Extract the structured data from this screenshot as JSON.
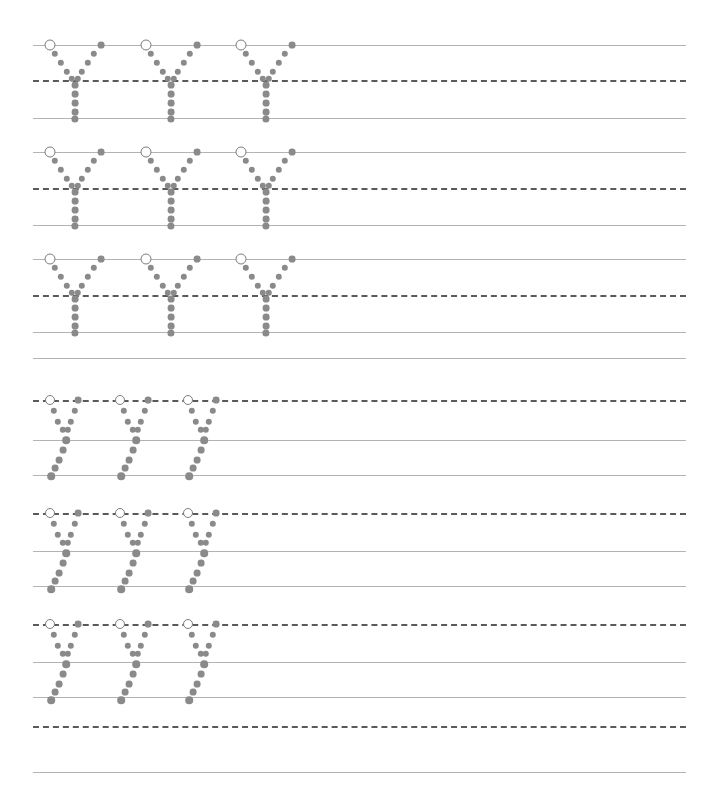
{
  "worksheet": {
    "title": "Letter Y Tracing Practice Worksheet",
    "description": "Handwriting practice sheet with dotted uppercase Y and lowercase y letters on three-line ruled guides",
    "page_width": 708,
    "page_height": 806,
    "background_color": "#ffffff",
    "line_color": "#b3b3b3",
    "dashed_line_color": "#5a5a5a",
    "dot_color": "#8a8a8a",
    "start_circle_color": "#7d7d7d",
    "line_left": 33,
    "line_right": 686
  },
  "rows": [
    {
      "name": "uppercase-y-row-1",
      "letter": "Y",
      "case": "uppercase",
      "top_line_y": 45,
      "mid_line_y": 80,
      "base_line_y": 118,
      "letter_x_positions": [
        50,
        146,
        241
      ],
      "letter_count": 3
    },
    {
      "name": "uppercase-y-row-2",
      "letter": "Y",
      "case": "uppercase",
      "top_line_y": 152,
      "mid_line_y": 188,
      "base_line_y": 225,
      "letter_x_positions": [
        50,
        146,
        241
      ],
      "letter_count": 3
    },
    {
      "name": "uppercase-y-row-3",
      "letter": "Y",
      "case": "uppercase",
      "top_line_y": 259,
      "mid_line_y": 295,
      "base_line_y": 332,
      "letter_x_positions": [
        50,
        146,
        241
      ],
      "letter_count": 3
    },
    {
      "name": "lowercase-y-row-1",
      "letter": "y",
      "case": "lowercase",
      "top_line_y": 358,
      "mid_line_y": 400,
      "base_line_y": 440,
      "descender_line_y": 475,
      "letter_x_positions": [
        50,
        120,
        188
      ],
      "letter_count": 3
    },
    {
      "name": "lowercase-y-row-2",
      "letter": "y",
      "case": "lowercase",
      "top_line_y": 475,
      "mid_line_y": 513,
      "base_line_y": 551,
      "descender_line_y": 586,
      "letter_x_positions": [
        50,
        120,
        188
      ],
      "letter_count": 3
    },
    {
      "name": "lowercase-y-row-3",
      "letter": "y",
      "case": "lowercase",
      "top_line_y": 586,
      "mid_line_y": 624,
      "base_line_y": 662,
      "descender_line_y": 697,
      "letter_x_positions": [
        50,
        120,
        188
      ],
      "letter_count": 3
    },
    {
      "name": "blank-practice-row",
      "letter": "",
      "case": "blank",
      "top_line_y": 697,
      "mid_line_y": 726,
      "base_line_y": 772,
      "letter_x_positions": [],
      "letter_count": 0
    }
  ],
  "glyph_templates": {
    "uppercase_Y": {
      "description": "Capital Y: left diagonal from top-left down to center, right diagonal from top-right down to center, vertical stem to baseline",
      "start_marker": {
        "dx": 0,
        "dy": 0,
        "r": 5.5
      },
      "dots": [
        {
          "dx": 5,
          "dy": 9,
          "r": 3.2
        },
        {
          "dx": 11,
          "dy": 18,
          "r": 3.2
        },
        {
          "dx": 17,
          "dy": 27,
          "r": 3.2
        },
        {
          "dx": 22,
          "dy": 34,
          "r": 3.2
        },
        {
          "dx": 51,
          "dy": 0,
          "r": 3.4
        },
        {
          "dx": 44,
          "dy": 9,
          "r": 3.2
        },
        {
          "dx": 38,
          "dy": 18,
          "r": 3.2
        },
        {
          "dx": 32,
          "dy": 27,
          "r": 3.2
        },
        {
          "dx": 28,
          "dy": 34,
          "r": 3.2
        },
        {
          "dx": 25,
          "dy": 40,
          "r": 3.4
        },
        {
          "dx": 25,
          "dy": 49,
          "r": 3.4
        },
        {
          "dx": 25,
          "dy": 58,
          "r": 3.4
        },
        {
          "dx": 25,
          "dy": 67,
          "r": 3.4
        },
        {
          "dx": 25,
          "dy": 74,
          "r": 3.6
        }
      ]
    },
    "lowercase_y": {
      "description": "Lowercase y: short left diagonal from midline to baseline, short right diagonal from midline down, then descender tail angling down-left below baseline",
      "start_marker": {
        "dx": 0,
        "dy": 0,
        "r": 5.0
      },
      "dots": [
        {
          "dx": 4,
          "dy": 11,
          "r": 3.2
        },
        {
          "dx": 8,
          "dy": 22,
          "r": 3.2
        },
        {
          "dx": 13,
          "dy": 30,
          "r": 3.2
        },
        {
          "dx": 28,
          "dy": 0,
          "r": 3.4
        },
        {
          "dx": 25,
          "dy": 11,
          "r": 3.2
        },
        {
          "dx": 21,
          "dy": 22,
          "r": 3.2
        },
        {
          "dx": 18,
          "dy": 30,
          "r": 3.2
        },
        {
          "dx": 16,
          "dy": 40,
          "r": 3.8
        },
        {
          "dx": 13,
          "dy": 50,
          "r": 3.4
        },
        {
          "dx": 9,
          "dy": 60,
          "r": 3.4
        },
        {
          "dx": 5,
          "dy": 68,
          "r": 3.4
        },
        {
          "dx": 1,
          "dy": 76,
          "r": 3.8
        }
      ]
    }
  }
}
